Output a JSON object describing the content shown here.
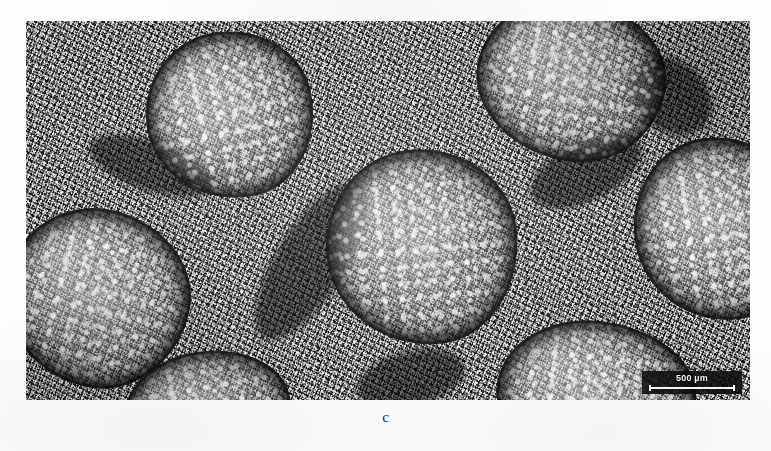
{
  "figure": {
    "panel_label": "c",
    "caption_label": "c"
  },
  "micrograph": {
    "alt_description": "Grayscale light micrograph of fibrous tissue containing rounded fascicle-like bundles",
    "modality": "light-microscopy",
    "color_mode": "grayscale",
    "background_color": "#7d7d7d",
    "page_background_color": "#fdfdfd"
  },
  "scale_bar": {
    "value": "500",
    "unit": "µm",
    "label": "500 µm",
    "text_color": "#f2f2f2",
    "box_color": "#0c0c0c",
    "position": "bottom-right"
  },
  "structures": {
    "count": 7,
    "name": "rounded fascicle bundles",
    "surrounding_tissue": "dense dark fibrous stroma"
  }
}
